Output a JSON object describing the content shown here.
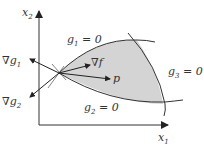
{
  "diagram": {
    "axes": {
      "x_label": "x",
      "x_sub": "1",
      "y_label": "x",
      "y_sub": "2"
    },
    "constraints": [
      {
        "id": "g1",
        "label": "g",
        "sub": "1",
        "eq": " = 0"
      },
      {
        "id": "g2",
        "label": "g",
        "sub": "2",
        "eq": " = 0"
      },
      {
        "id": "g3",
        "label": "g",
        "sub": "3",
        "eq": " = 0"
      }
    ],
    "vectors": [
      {
        "id": "grad-f",
        "nabla": "∇",
        "label": "f"
      },
      {
        "id": "p",
        "label": "p"
      },
      {
        "id": "grad-g1",
        "nabla": "∇",
        "label": "g",
        "sub": "1"
      },
      {
        "id": "grad-g2",
        "nabla": "∇",
        "label": "g",
        "sub": "2"
      }
    ],
    "colors": {
      "feasible_region": "#d4d4d4",
      "stroke": "#333333",
      "background": "#ffffff"
    }
  }
}
